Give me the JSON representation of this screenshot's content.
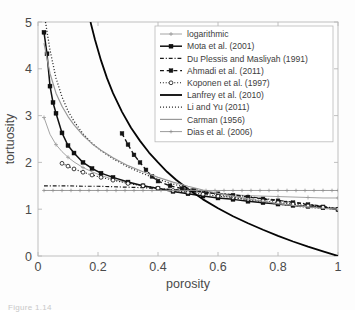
{
  "figure": {
    "caption_partial": "Figure 1.14"
  },
  "chart_data": {
    "type": "line",
    "title": "",
    "xlabel": "porosity",
    "ylabel": "tortuosity",
    "xlim": [
      0,
      1
    ],
    "ylim": [
      0,
      5
    ],
    "xticks": [
      0,
      0.2,
      0.4,
      0.6,
      0.8,
      1
    ],
    "xtick_labels": [
      "0",
      "0.2",
      "0.4",
      "0.6",
      "0.8",
      "1"
    ],
    "yticks": [
      0,
      1,
      2,
      3,
      4,
      5
    ],
    "ytick_labels": [
      "0",
      "1",
      "2",
      "3",
      "4",
      "5"
    ],
    "grid": false,
    "legend_position": "upper-right",
    "series": [
      {
        "name": "logarithmic",
        "label": "logarithmic",
        "color": "#9a9a9a",
        "width": 0.9,
        "dash": "none",
        "marker": "plus",
        "marker_size": 2.0,
        "marker_step": 2,
        "x": [
          0.02,
          0.04,
          0.06,
          0.08,
          0.1,
          0.12,
          0.15,
          0.18,
          0.21,
          0.25,
          0.3,
          0.35,
          0.4,
          0.45,
          0.5,
          0.55,
          0.6,
          0.65,
          0.7,
          0.75,
          0.8,
          0.85,
          0.9,
          0.95,
          1.0
        ],
        "y": [
          2.96,
          2.6,
          2.38,
          2.23,
          2.11,
          2.01,
          1.89,
          1.8,
          1.72,
          1.64,
          1.56,
          1.5,
          1.45,
          1.41,
          1.38,
          1.35,
          1.33,
          1.31,
          1.29,
          1.28,
          1.27,
          1.26,
          1.25,
          1.24,
          1.24
        ]
      },
      {
        "name": "mota",
        "label": "Mota et al. (2001)",
        "color": "#111111",
        "width": 1.5,
        "dash": "none",
        "marker": "square",
        "marker_size": 2.0,
        "marker_step": 1,
        "x": [
          0.02,
          0.03,
          0.04,
          0.05,
          0.06,
          0.08,
          0.1,
          0.12,
          0.15,
          0.18,
          0.21,
          0.25,
          0.3,
          0.35,
          0.4,
          0.45,
          0.5,
          0.55,
          0.6,
          0.65,
          0.7,
          0.75,
          0.8,
          0.85,
          0.9,
          0.95,
          1.0
        ],
        "y": [
          4.78,
          4.32,
          3.63,
          3.28,
          3.05,
          2.63,
          2.36,
          2.2,
          2.0,
          1.87,
          1.77,
          1.68,
          1.58,
          1.5,
          1.44,
          1.38,
          1.33,
          1.28,
          1.24,
          1.21,
          1.17,
          1.14,
          1.11,
          1.08,
          1.06,
          1.03,
          1.0
        ]
      },
      {
        "name": "du-plessis-masliyah",
        "label": "Du Plessis and Masliyah (1991)",
        "color": "#1a1a1a",
        "width": 1.2,
        "dash": "dashdot",
        "marker": "none",
        "marker_size": 0,
        "marker_step": 1,
        "x": [
          0.02,
          0.06,
          0.1,
          0.15,
          0.2,
          0.25,
          0.3,
          0.35,
          0.4,
          0.45,
          0.5,
          0.55,
          0.6,
          0.65,
          0.7,
          0.75,
          0.8,
          0.85,
          0.9,
          0.95,
          1.0
        ],
        "y": [
          1.5,
          1.5,
          1.5,
          1.49,
          1.49,
          1.48,
          1.47,
          1.46,
          1.44,
          1.42,
          1.4,
          1.37,
          1.34,
          1.31,
          1.27,
          1.23,
          1.19,
          1.15,
          1.11,
          1.06,
          1.01
        ]
      },
      {
        "name": "ahmadi",
        "label": "Ahmadi et al. (2011)",
        "color": "#151515",
        "width": 1.4,
        "dash": "dash",
        "marker": "square",
        "marker_size": 1.9,
        "marker_step": 1,
        "x": [
          0.28,
          0.3,
          0.32,
          0.34,
          0.36,
          0.38,
          0.4,
          0.44,
          0.48,
          0.52,
          0.56,
          0.6,
          0.65,
          0.7,
          0.75,
          0.8,
          0.85,
          0.9,
          0.95,
          1.0
        ],
        "y": [
          2.62,
          2.38,
          2.16,
          2.0,
          1.84,
          1.7,
          1.6,
          1.5,
          1.44,
          1.4,
          1.36,
          1.33,
          1.3,
          1.26,
          1.22,
          1.18,
          1.14,
          1.1,
          1.05,
          1.0
        ]
      },
      {
        "name": "koponen",
        "label": "Koponen et al. (1997)",
        "color": "#111111",
        "width": 1.1,
        "dash": "dot",
        "marker": "circle",
        "marker_size": 1.9,
        "marker_step": 1,
        "x": [
          0.08,
          0.1,
          0.12,
          0.15,
          0.18,
          0.21,
          0.25,
          0.3,
          0.35,
          0.4,
          0.45,
          0.5,
          0.55,
          0.6,
          0.65,
          0.7,
          0.75,
          0.8,
          0.85,
          0.9,
          0.95,
          1.0
        ],
        "y": [
          1.98,
          1.92,
          1.86,
          1.79,
          1.73,
          1.68,
          1.62,
          1.55,
          1.5,
          1.45,
          1.4,
          1.36,
          1.32,
          1.28,
          1.25,
          1.21,
          1.18,
          1.14,
          1.11,
          1.07,
          1.04,
          1.0
        ]
      },
      {
        "name": "lanfrey",
        "label": "Lanfrey et al. (2010)",
        "color": "#050505",
        "width": 1.8,
        "dash": "none",
        "marker": "none",
        "marker_size": 0,
        "marker_step": 1,
        "x": [
          0.175,
          0.19,
          0.21,
          0.23,
          0.25,
          0.28,
          0.31,
          0.34,
          0.37,
          0.4,
          0.43,
          0.46,
          0.5,
          0.55,
          0.6,
          0.65,
          0.7,
          0.75,
          0.8,
          0.85,
          0.9,
          0.95,
          1.0
        ],
        "y": [
          5.0,
          4.62,
          4.18,
          3.8,
          3.48,
          3.08,
          2.74,
          2.46,
          2.21,
          2.0,
          1.8,
          1.63,
          1.43,
          1.21,
          1.02,
          0.85,
          0.7,
          0.56,
          0.43,
          0.31,
          0.2,
          0.1,
          0.0
        ]
      },
      {
        "name": "li-and-yu",
        "label": "Li and Yu (2011)",
        "color": "#2a2a2a",
        "width": 1.3,
        "dash": "finedot",
        "marker": "none",
        "marker_size": 0,
        "marker_step": 1,
        "x": [
          0.025,
          0.04,
          0.06,
          0.08,
          0.1,
          0.12,
          0.15,
          0.18,
          0.21,
          0.25,
          0.3,
          0.35,
          0.4,
          0.45,
          0.5,
          0.55,
          0.6,
          0.65,
          0.7,
          0.75,
          0.8,
          0.85,
          0.9,
          0.95,
          1.0
        ],
        "y": [
          5.0,
          4.4,
          3.8,
          3.4,
          3.1,
          2.88,
          2.61,
          2.41,
          2.25,
          2.08,
          1.9,
          1.76,
          1.64,
          1.54,
          1.45,
          1.38,
          1.31,
          1.25,
          1.2,
          1.15,
          1.11,
          1.07,
          1.04,
          1.02,
          1.0
        ]
      },
      {
        "name": "carman",
        "label": "Carman (1956)",
        "color": "#999999",
        "width": 1.2,
        "dash": "none",
        "marker": "none",
        "marker_size": 0,
        "marker_step": 1,
        "x": [
          0.02,
          0.04,
          0.06,
          0.08,
          0.1,
          0.12,
          0.15,
          0.18,
          0.21,
          0.25,
          0.3,
          0.35,
          0.4,
          0.45,
          0.5,
          0.55,
          0.6,
          0.65,
          0.7,
          0.75,
          0.8,
          0.85,
          0.9,
          0.95,
          1.0
        ],
        "y": [
          4.55,
          3.9,
          3.48,
          3.2,
          2.98,
          2.8,
          2.58,
          2.4,
          2.26,
          2.1,
          1.93,
          1.8,
          1.68,
          1.58,
          1.49,
          1.41,
          1.34,
          1.28,
          1.22,
          1.17,
          1.12,
          1.08,
          1.05,
          1.02,
          1.0
        ]
      },
      {
        "name": "dias",
        "label": "Dias et al. (2006)",
        "color": "#8f8f8f",
        "width": 0.9,
        "dash": "none",
        "marker": "plus",
        "marker_size": 1.8,
        "marker_step": 1,
        "x": [
          0.02,
          0.05,
          0.08,
          0.11,
          0.14,
          0.17,
          0.2,
          0.23,
          0.26,
          0.29,
          0.32,
          0.35,
          0.38,
          0.41,
          0.44,
          0.47,
          0.5,
          0.53,
          0.56,
          0.59,
          0.62,
          0.65,
          0.68,
          0.71,
          0.74,
          0.77,
          0.8,
          0.83,
          0.86,
          0.89,
          0.92,
          0.95,
          0.98,
          1.0
        ],
        "y": [
          1.4,
          1.4,
          1.4,
          1.4,
          1.4,
          1.4,
          1.4,
          1.4,
          1.4,
          1.4,
          1.4,
          1.4,
          1.4,
          1.4,
          1.4,
          1.4,
          1.4,
          1.4,
          1.4,
          1.4,
          1.4,
          1.4,
          1.4,
          1.4,
          1.4,
          1.4,
          1.4,
          1.4,
          1.4,
          1.4,
          1.4,
          1.4,
          1.4,
          1.4
        ]
      }
    ]
  }
}
